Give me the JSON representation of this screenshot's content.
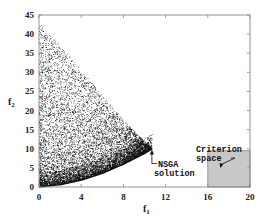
{
  "chart_data": {
    "type": "scatter",
    "title": "",
    "xlabel": "f1",
    "ylabel": "f2",
    "xlim": [
      0,
      20
    ],
    "ylim": [
      0,
      45
    ],
    "xticks": [
      0,
      4,
      8,
      12,
      16,
      20
    ],
    "yticks": [
      0,
      5,
      10,
      15,
      20,
      25,
      30,
      35,
      40,
      45
    ],
    "grid": false,
    "legend": null,
    "series": [
      {
        "name": "Random feasible points",
        "description": "Dense cloud of points bounded above by a line from (0,43) to (10.7,10) and below by a convex curve from (0,0) to (10.7,10)",
        "upper_boundary": [
          [
            0,
            43
          ],
          [
            2,
            37
          ],
          [
            4,
            30.5
          ],
          [
            6,
            24
          ],
          [
            8,
            17.5
          ],
          [
            10,
            12
          ],
          [
            10.7,
            10
          ]
        ],
        "lower_boundary": [
          [
            0,
            0
          ],
          [
            2,
            0.6
          ],
          [
            4,
            1.8
          ],
          [
            6,
            3.6
          ],
          [
            8,
            6
          ],
          [
            10,
            8.8
          ],
          [
            10.7,
            10
          ]
        ],
        "point_count_approx": 9000,
        "color": "#111111"
      }
    ],
    "annotations": [
      {
        "text_lines": [
          "NSGA",
          "solution"
        ],
        "arrow_to": [
          10.7,
          9.8
        ],
        "text_at": [
          10.9,
          5.5
        ]
      },
      {
        "text_lines": [
          "Criterion",
          "space"
        ],
        "arrow_to": [
          17.2,
          5
        ],
        "text_at": [
          16.0,
          12.2
        ]
      }
    ],
    "shaded_regions": [
      {
        "name": "Criterion space",
        "x": [
          16,
          20
        ],
        "y": [
          0,
          9.5
        ],
        "color": "#c8c8c8"
      }
    ]
  },
  "labels": {
    "x_axis_main": "f",
    "x_axis_sub": "1",
    "y_axis_main": "f",
    "y_axis_sub": "2",
    "nsga_line1": "NSGA",
    "nsga_line2": "solution",
    "criterion_line1": "Criterion",
    "criterion_line2": "space"
  },
  "colors": {
    "axis": "#888888",
    "points": "#111111",
    "criterion_fill": "#c8c8c8",
    "criterion_border": "#888888",
    "text": "#222222"
  }
}
